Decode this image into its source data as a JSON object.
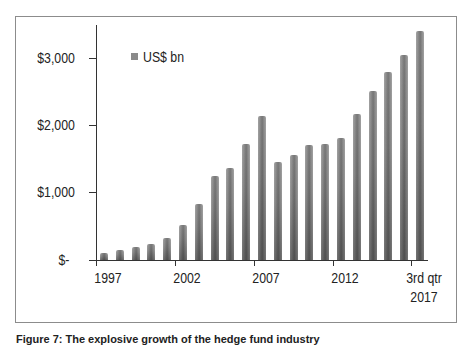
{
  "chart_data": {
    "type": "bar",
    "title": "",
    "xlabel": "",
    "ylabel": "",
    "ylim": [
      0,
      3500
    ],
    "grid": false,
    "legend_position": "top-left inside",
    "legend": [
      "US$ bn"
    ],
    "yticks": [
      {
        "value": 0,
        "label": "$-"
      },
      {
        "value": 1000,
        "label": "$1,000"
      },
      {
        "value": 2000,
        "label": "$2,000"
      },
      {
        "value": 3000,
        "label": "$3,000"
      }
    ],
    "xtick_labels": [
      "1997",
      "2002",
      "2007",
      "2012",
      "3rd qtr 2017"
    ],
    "categories": [
      "1997",
      "1998",
      "1999",
      "2000",
      "2001",
      "2002",
      "2003",
      "2004",
      "2005",
      "2006",
      "2007",
      "2008",
      "2009",
      "2010",
      "2011",
      "2012",
      "2013",
      "2014",
      "2015",
      "2016",
      "3rd qtr 2017"
    ],
    "series": [
      {
        "name": "US$ bn",
        "values": [
          100,
          150,
          190,
          240,
          330,
          520,
          830,
          1250,
          1370,
          1720,
          2140,
          1460,
          1560,
          1710,
          1720,
          1810,
          2170,
          2510,
          2800,
          3040,
          3400
        ]
      }
    ]
  },
  "labels": {
    "y": [
      "$3,000",
      "$2,000",
      "$1,000",
      "$-"
    ],
    "x": [
      "1997",
      "2002",
      "2007",
      "2012"
    ],
    "x_last_line1": "3rd qtr",
    "x_last_line2": "2017",
    "legend": "US$ bn"
  },
  "caption": "Figure 7: The explosive growth of the hedge fund industry"
}
